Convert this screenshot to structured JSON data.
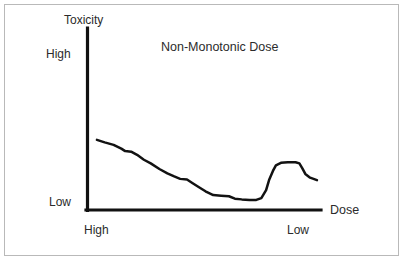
{
  "chart_data": {
    "type": "line",
    "title": "Non-Monotonic Dose",
    "xlabel": "Dose",
    "ylabel": "Toxicity",
    "x_tick_labels": [
      "High",
      "Low"
    ],
    "y_tick_labels": [
      "High",
      "Low"
    ],
    "x_axis_direction": "high-to-low",
    "y_axis_direction": "low-to-high",
    "grid": false,
    "legend": "none",
    "xlim": [
      0,
      100
    ],
    "ylim": [
      0,
      100
    ],
    "series": [
      {
        "name": "Toxicity response",
        "description": "Non-monotonic dose-response: steady decline from high dose, a low plateau trough, then a secondary rebound peak at low dose before tapering.",
        "points": [
          {
            "x": 2.6,
            "y": 60.8
          },
          {
            "x": 6.0,
            "y": 58.6
          },
          {
            "x": 9.9,
            "y": 56.4
          },
          {
            "x": 13.3,
            "y": 53.0
          },
          {
            "x": 15.0,
            "y": 50.8
          },
          {
            "x": 17.6,
            "y": 50.3
          },
          {
            "x": 20.2,
            "y": 47.5
          },
          {
            "x": 23.2,
            "y": 43.1
          },
          {
            "x": 26.2,
            "y": 39.8
          },
          {
            "x": 30.0,
            "y": 34.8
          },
          {
            "x": 33.5,
            "y": 30.9
          },
          {
            "x": 36.5,
            "y": 28.2
          },
          {
            "x": 39.1,
            "y": 26.0
          },
          {
            "x": 42.1,
            "y": 25.4
          },
          {
            "x": 44.6,
            "y": 22.1
          },
          {
            "x": 47.2,
            "y": 18.8
          },
          {
            "x": 50.2,
            "y": 14.9
          },
          {
            "x": 53.6,
            "y": 11.6
          },
          {
            "x": 57.1,
            "y": 11.0
          },
          {
            "x": 60.5,
            "y": 10.5
          },
          {
            "x": 63.1,
            "y": 8.3
          },
          {
            "x": 66.1,
            "y": 7.7
          },
          {
            "x": 69.5,
            "y": 7.2
          },
          {
            "x": 72.5,
            "y": 7.2
          },
          {
            "x": 74.7,
            "y": 8.8
          },
          {
            "x": 76.8,
            "y": 16.0
          },
          {
            "x": 78.1,
            "y": 24.9
          },
          {
            "x": 79.8,
            "y": 33.1
          },
          {
            "x": 81.1,
            "y": 38.1
          },
          {
            "x": 83.3,
            "y": 40.3
          },
          {
            "x": 86.3,
            "y": 40.9
          },
          {
            "x": 89.7,
            "y": 40.9
          },
          {
            "x": 91.4,
            "y": 39.8
          },
          {
            "x": 92.7,
            "y": 35.4
          },
          {
            "x": 94.0,
            "y": 30.4
          },
          {
            "x": 96.1,
            "y": 27.1
          },
          {
            "x": 99.1,
            "y": 24.9
          }
        ]
      }
    ]
  },
  "colors": {
    "curve": "#121212",
    "axis": "#111111",
    "text": "#2b2b2b",
    "frame_border": "#b9b9b9",
    "background": "#ffffff"
  }
}
